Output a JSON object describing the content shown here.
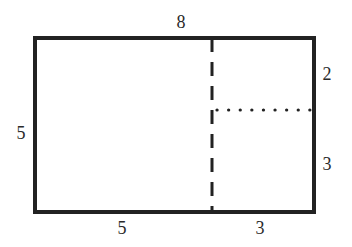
{
  "diagram": {
    "type": "rectangle-partition",
    "colors": {
      "stroke": "#222222",
      "background": "#ffffff",
      "text": "#2a2a2a"
    },
    "labels": {
      "top_width": "8",
      "left_height": "5",
      "right_top_height": "2",
      "right_bottom_height": "3",
      "bottom_left_width": "5",
      "bottom_right_width": "3"
    },
    "lines": {
      "outer": "solid",
      "vertical_divider": "dashed",
      "horizontal_divider": "dotted"
    }
  }
}
